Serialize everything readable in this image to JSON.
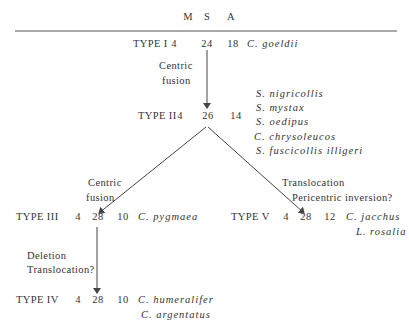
{
  "header": {
    "columns": [
      "M",
      "S",
      "A"
    ]
  },
  "types": [
    {
      "id": "type-1",
      "label": "TYPE I",
      "M": "4",
      "S": "24",
      "A": "18",
      "species": [
        "C. goeldii"
      ]
    },
    {
      "id": "type-2",
      "label": "TYPE II",
      "M": "4",
      "S": "26",
      "A": "14",
      "species": [
        "S. nigricollis",
        "S. mystax",
        "S. oedipus",
        "C. chrysoleucos",
        "S. fuscicollis illigeri"
      ]
    },
    {
      "id": "type-3",
      "label": "TYPE III",
      "M": "4",
      "S": "28",
      "A": "10",
      "species": [
        "C. pygmaea"
      ]
    },
    {
      "id": "type-4",
      "label": "TYPE IV",
      "M": "4",
      "S": "28",
      "A": "10",
      "species": [
        "C. humeralifer",
        "C. argentatus"
      ]
    },
    {
      "id": "type-5",
      "label": "TYPE V",
      "M": "4",
      "S": "28",
      "A": "12",
      "species": [
        "C. jacchus",
        "L. rosalia"
      ]
    }
  ],
  "transitions": [
    {
      "from": "TYPE I",
      "to": "TYPE II",
      "lines": [
        "Centric",
        "fusion"
      ]
    },
    {
      "from": "TYPE II",
      "to": "TYPE III",
      "lines": [
        "Centric",
        "fusion"
      ]
    },
    {
      "from": "TYPE II",
      "to": "TYPE V",
      "lines": [
        "Translocation",
        "Pericentric inversion?"
      ]
    },
    {
      "from": "TYPE III",
      "to": "TYPE IV",
      "lines": [
        "Deletion",
        "Translocation?"
      ]
    }
  ],
  "colors": {
    "text": "#333333",
    "lines": "#444444",
    "background": "#ffffff"
  }
}
